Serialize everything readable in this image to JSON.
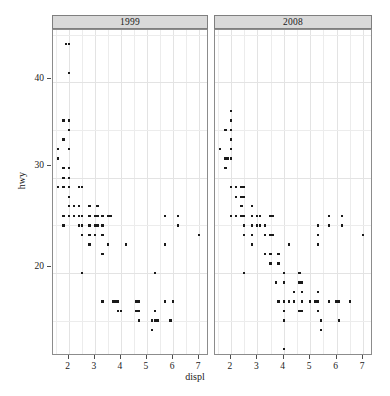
{
  "chart_data": {
    "type": "scatter",
    "title": "",
    "xlabel": "displ",
    "ylabel": "hwy",
    "xlim": [
      1.4,
      7.3
    ],
    "ylim": [
      11.5,
      45.5
    ],
    "xticks": [
      2,
      3,
      4,
      5,
      6,
      7
    ],
    "yticks": [
      20,
      30,
      40
    ],
    "grid": true,
    "legend": "none",
    "facet_variable": "year",
    "facets": [
      {
        "label": "1999",
        "points": [
          [
            1.8,
            29
          ],
          [
            1.8,
            29
          ],
          [
            2.0,
            31
          ],
          [
            2.0,
            30
          ],
          [
            2.8,
            26
          ],
          [
            2.8,
            26
          ],
          [
            3.1,
            27
          ],
          [
            1.8,
            26
          ],
          [
            1.8,
            25
          ],
          [
            2.0,
            28
          ],
          [
            2.0,
            27
          ],
          [
            2.8,
            25
          ],
          [
            2.8,
            25
          ],
          [
            3.1,
            25
          ],
          [
            3.1,
            25
          ],
          [
            2.8,
            24
          ],
          [
            3.1,
            25
          ],
          [
            4.2,
            23
          ],
          [
            5.3,
            20
          ],
          [
            5.3,
            15
          ],
          [
            5.7,
            17
          ],
          [
            6.0,
            17
          ],
          [
            5.7,
            26
          ],
          [
            5.7,
            23
          ],
          [
            6.2,
            26
          ],
          [
            6.2,
            25
          ],
          [
            7.0,
            24
          ],
          [
            5.3,
            16
          ],
          [
            5.3,
            16
          ],
          [
            5.7,
            17
          ],
          [
            2.4,
            26
          ],
          [
            2.4,
            25
          ],
          [
            3.1,
            26
          ],
          [
            3.5,
            26
          ],
          [
            3.6,
            26
          ],
          [
            2.4,
            27
          ],
          [
            3.0,
            26
          ],
          [
            3.3,
            25
          ],
          [
            3.3,
            24
          ],
          [
            3.3,
            17
          ],
          [
            3.3,
            17
          ],
          [
            3.3,
            17
          ],
          [
            3.8,
            17
          ],
          [
            3.8,
            17
          ],
          [
            4.0,
            16
          ],
          [
            3.7,
            17
          ],
          [
            3.7,
            17
          ],
          [
            3.9,
            17
          ],
          [
            3.9,
            17
          ],
          [
            4.7,
            16
          ],
          [
            4.7,
            16
          ],
          [
            4.7,
            17
          ],
          [
            5.2,
            15
          ],
          [
            5.2,
            15
          ],
          [
            3.9,
            16
          ],
          [
            4.7,
            15
          ],
          [
            4.7,
            15
          ],
          [
            4.7,
            16
          ],
          [
            5.2,
            15
          ],
          [
            5.9,
            15
          ],
          [
            4.7,
            16
          ],
          [
            4.7,
            16
          ],
          [
            4.7,
            16
          ],
          [
            4.7,
            15
          ],
          [
            5.2,
            14
          ],
          [
            3.8,
            17
          ],
          [
            3.8,
            17
          ],
          [
            4.0,
            16
          ],
          [
            4.0,
            16
          ],
          [
            4.6,
            16
          ],
          [
            4.6,
            16
          ],
          [
            4.6,
            17
          ],
          [
            5.4,
            15
          ],
          [
            1.6,
            33
          ],
          [
            1.6,
            32
          ],
          [
            1.6,
            32
          ],
          [
            1.6,
            29
          ],
          [
            1.6,
            32
          ],
          [
            1.8,
            34
          ],
          [
            1.8,
            36
          ],
          [
            2.0,
            36
          ],
          [
            2.4,
            29
          ],
          [
            2.4,
            29
          ],
          [
            2.5,
            29
          ],
          [
            2.5,
            29
          ],
          [
            3.3,
            24
          ],
          [
            2.0,
            44
          ],
          [
            2.0,
            41
          ],
          [
            2.0,
            29
          ],
          [
            2.0,
            26
          ],
          [
            2.5,
            26
          ],
          [
            2.5,
            25
          ],
          [
            2.8,
            25
          ],
          [
            2.8,
            24
          ],
          [
            3.3,
            22
          ],
          [
            2.2,
            26
          ],
          [
            2.2,
            27
          ],
          [
            2.4,
            26
          ],
          [
            2.4,
            26
          ],
          [
            3.0,
            25
          ],
          [
            3.0,
            24
          ],
          [
            3.5,
            23
          ],
          [
            2.2,
            26
          ],
          [
            2.2,
            26
          ],
          [
            2.4,
            26
          ],
          [
            2.4,
            26
          ],
          [
            3.0,
            26
          ],
          [
            3.0,
            26
          ],
          [
            3.3,
            26
          ],
          [
            1.8,
            31
          ],
          [
            1.8,
            30
          ],
          [
            2.0,
            33
          ],
          [
            2.0,
            35
          ],
          [
            2.8,
            27
          ],
          [
            1.9,
            44
          ],
          [
            2.0,
            29
          ],
          [
            2.5,
            24
          ],
          [
            2.5,
            24
          ],
          [
            2.5,
            25
          ],
          [
            2.8,
            24
          ],
          [
            2.8,
            23
          ],
          [
            2.5,
            20
          ],
          [
            2.2,
            26
          ]
        ]
      },
      {
        "label": "2008",
        "points": [
          [
            3.1,
            26
          ],
          [
            3.1,
            25
          ],
          [
            2.8,
            26
          ],
          [
            3.1,
            25
          ],
          [
            4.2,
            23
          ],
          [
            5.3,
            25
          ],
          [
            5.3,
            24
          ],
          [
            5.3,
            23
          ],
          [
            5.7,
            26
          ],
          [
            6.0,
            17
          ],
          [
            5.7,
            25
          ],
          [
            6.2,
            26
          ],
          [
            6.2,
            25
          ],
          [
            7.0,
            24
          ],
          [
            5.3,
            16
          ],
          [
            5.3,
            16
          ],
          [
            5.7,
            17
          ],
          [
            6.5,
            17
          ],
          [
            2.4,
            26
          ],
          [
            2.4,
            27
          ],
          [
            3.1,
            26
          ],
          [
            3.5,
            26
          ],
          [
            3.6,
            26
          ],
          [
            2.4,
            27
          ],
          [
            3.0,
            26
          ],
          [
            3.3,
            25
          ],
          [
            3.3,
            24
          ],
          [
            4.0,
            17
          ],
          [
            4.0,
            17
          ],
          [
            4.6,
            16
          ],
          [
            5.0,
            17
          ],
          [
            4.2,
            17
          ],
          [
            4.4,
            17
          ],
          [
            4.6,
            16
          ],
          [
            5.4,
            14
          ],
          [
            5.4,
            14
          ],
          [
            4.0,
            16
          ],
          [
            4.0,
            15
          ],
          [
            4.6,
            16
          ],
          [
            5.4,
            15
          ],
          [
            3.8,
            17
          ],
          [
            3.8,
            17
          ],
          [
            5.3,
            17
          ],
          [
            5.3,
            18
          ],
          [
            5.3,
            18
          ],
          [
            5.7,
            17
          ],
          [
            4.7,
            19
          ],
          [
            4.7,
            18
          ],
          [
            4.7,
            19
          ],
          [
            5.7,
            17
          ],
          [
            6.1,
            17
          ],
          [
            4.0,
            12
          ],
          [
            4.7,
            17
          ],
          [
            4.7,
            16
          ],
          [
            5.7,
            17
          ],
          [
            6.1,
            15
          ],
          [
            1.6,
            33
          ],
          [
            1.8,
            35
          ],
          [
            2.0,
            37
          ],
          [
            2.0,
            35
          ],
          [
            2.0,
            34
          ],
          [
            2.0,
            32
          ],
          [
            2.4,
            29
          ],
          [
            2.4,
            29
          ],
          [
            2.5,
            29
          ],
          [
            2.5,
            28
          ],
          [
            3.3,
            24
          ],
          [
            2.0,
            36
          ],
          [
            2.0,
            36
          ],
          [
            2.0,
            29
          ],
          [
            2.0,
            26
          ],
          [
            2.5,
            26
          ],
          [
            2.5,
            25
          ],
          [
            2.8,
            25
          ],
          [
            2.8,
            24
          ],
          [
            3.3,
            22
          ],
          [
            2.2,
            29
          ],
          [
            2.2,
            29
          ],
          [
            2.4,
            28
          ],
          [
            2.4,
            27
          ],
          [
            3.0,
            26
          ],
          [
            3.0,
            25
          ],
          [
            3.5,
            24
          ],
          [
            2.2,
            29
          ],
          [
            2.2,
            28
          ],
          [
            2.4,
            27
          ],
          [
            2.4,
            26
          ],
          [
            3.0,
            26
          ],
          [
            3.0,
            26
          ],
          [
            3.3,
            25
          ],
          [
            1.8,
            32
          ],
          [
            1.8,
            31
          ],
          [
            2.0,
            33
          ],
          [
            2.0,
            35
          ],
          [
            2.8,
            27
          ],
          [
            1.9,
            32
          ],
          [
            2.0,
            29
          ],
          [
            2.5,
            24
          ],
          [
            2.5,
            24
          ],
          [
            2.5,
            25
          ],
          [
            2.8,
            24
          ],
          [
            2.8,
            23
          ],
          [
            2.5,
            20
          ],
          [
            2.2,
            26
          ],
          [
            3.6,
            24
          ],
          [
            3.8,
            22
          ],
          [
            3.8,
            21
          ],
          [
            4.0,
            20
          ],
          [
            4.0,
            19
          ],
          [
            4.6,
            20
          ],
          [
            4.6,
            19
          ],
          [
            3.5,
            22
          ],
          [
            3.5,
            21
          ],
          [
            3.7,
            19
          ],
          [
            4.4,
            18
          ],
          [
            4.7,
            18
          ],
          [
            5.2,
            17
          ]
        ]
      }
    ]
  },
  "axis": {
    "ylabel_text": "hwy",
    "xlabel_text": "displ",
    "ytick_labels": [
      "40",
      "30",
      "20"
    ],
    "xtick_labels": [
      "2",
      "3",
      "4",
      "5",
      "6",
      "7"
    ]
  },
  "caption": ""
}
